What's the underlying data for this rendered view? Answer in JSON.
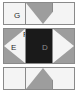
{
  "diagram": {
    "type": "geometric-region-map",
    "canvas": {
      "width": 78,
      "height": 92,
      "background": "#ffffff"
    },
    "palette": {
      "light_fill": "#f4f4f4",
      "gray_fill": "#9d9d9d",
      "dark_fill": "#1a1a1a",
      "outline": "#8a8a8a",
      "label_dark": "#2b2b2b",
      "label_light": "#8e8e8e"
    },
    "rows": [
      {
        "id": "top",
        "name": "top-row",
        "shape": "down-chevron",
        "fill": "#9d9d9d",
        "notch_fill": "#f4f4f4",
        "labels": [
          {
            "id": "G",
            "text": "G",
            "region": "left-cell"
          }
        ]
      },
      {
        "id": "middle",
        "name": "middle-row",
        "shape": "opposing-arrows",
        "center_fill": "#1a1a1a",
        "labels": [
          {
            "id": "F",
            "text": "F",
            "region": "left-cell-top-wedge"
          },
          {
            "id": "E",
            "text": "E",
            "region": "left-cell-arrow"
          },
          {
            "id": "D",
            "text": "D",
            "region": "center-square"
          }
        ]
      },
      {
        "id": "bottom",
        "name": "bottom-row",
        "shape": "up-chevron",
        "fill": "#9d9d9d",
        "notch_fill": "#f4f4f4",
        "labels": []
      }
    ],
    "labels": {
      "d": "D",
      "e": "E",
      "f": "F",
      "g": "G"
    }
  }
}
